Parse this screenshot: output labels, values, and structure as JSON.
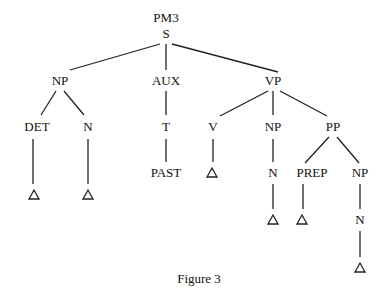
{
  "diagram": {
    "title": "PM3",
    "caption": "Figure 3",
    "nodes": [
      {
        "id": "s",
        "label": "S",
        "x": 166,
        "y": 34
      },
      {
        "id": "np1",
        "label": "NP",
        "x": 60,
        "y": 81
      },
      {
        "id": "aux",
        "label": "AUX",
        "x": 166,
        "y": 81
      },
      {
        "id": "vp",
        "label": "VP",
        "x": 273,
        "y": 81
      },
      {
        "id": "det",
        "label": "DET",
        "x": 37,
        "y": 127
      },
      {
        "id": "n1",
        "label": "N",
        "x": 88,
        "y": 127
      },
      {
        "id": "t",
        "label": "T",
        "x": 166,
        "y": 127
      },
      {
        "id": "v",
        "label": "V",
        "x": 213,
        "y": 127
      },
      {
        "id": "np2",
        "label": "NP",
        "x": 273,
        "y": 127
      },
      {
        "id": "pp",
        "label": "PP",
        "x": 333,
        "y": 127
      },
      {
        "id": "past",
        "label": "PAST",
        "x": 166,
        "y": 173
      },
      {
        "id": "n2",
        "label": "N",
        "x": 273,
        "y": 173
      },
      {
        "id": "prep",
        "label": "PREP",
        "x": 312,
        "y": 173
      },
      {
        "id": "np3",
        "label": "NP",
        "x": 360,
        "y": 173
      },
      {
        "id": "n3",
        "label": "N",
        "x": 360,
        "y": 220
      }
    ],
    "triangles": [
      {
        "under": "det",
        "x": 34,
        "y": 195
      },
      {
        "under": "n1",
        "x": 88,
        "y": 195
      },
      {
        "under": "v",
        "x": 212,
        "y": 173
      },
      {
        "under": "n2",
        "x": 273,
        "y": 220
      },
      {
        "under": "prep",
        "x": 302,
        "y": 220
      },
      {
        "under": "n3",
        "x": 360,
        "y": 268
      }
    ],
    "edges": [
      {
        "x1": 160,
        "y1": 44,
        "x2": 70,
        "y2": 70
      },
      {
        "x1": 166,
        "y1": 44,
        "x2": 166,
        "y2": 70
      },
      {
        "x1": 172,
        "y1": 44,
        "x2": 278,
        "y2": 72
      },
      {
        "x1": 56,
        "y1": 91,
        "x2": 41,
        "y2": 115
      },
      {
        "x1": 64,
        "y1": 91,
        "x2": 84,
        "y2": 115
      },
      {
        "x1": 166,
        "y1": 91,
        "x2": 166,
        "y2": 115
      },
      {
        "x1": 268,
        "y1": 91,
        "x2": 220,
        "y2": 116
      },
      {
        "x1": 273,
        "y1": 91,
        "x2": 273,
        "y2": 115
      },
      {
        "x1": 280,
        "y1": 91,
        "x2": 327,
        "y2": 116
      },
      {
        "x1": 33,
        "y1": 139,
        "x2": 33,
        "y2": 184
      },
      {
        "x1": 88,
        "y1": 139,
        "x2": 88,
        "y2": 184
      },
      {
        "x1": 166,
        "y1": 139,
        "x2": 166,
        "y2": 162
      },
      {
        "x1": 213,
        "y1": 139,
        "x2": 213,
        "y2": 162
      },
      {
        "x1": 273,
        "y1": 139,
        "x2": 273,
        "y2": 162
      },
      {
        "x1": 329,
        "y1": 137,
        "x2": 305,
        "y2": 163
      },
      {
        "x1": 337,
        "y1": 137,
        "x2": 359,
        "y2": 163
      },
      {
        "x1": 273,
        "y1": 184,
        "x2": 273,
        "y2": 209
      },
      {
        "x1": 303,
        "y1": 184,
        "x2": 303,
        "y2": 209
      },
      {
        "x1": 360,
        "y1": 184,
        "x2": 360,
        "y2": 209
      },
      {
        "x1": 360,
        "y1": 231,
        "x2": 360,
        "y2": 257
      }
    ]
  }
}
